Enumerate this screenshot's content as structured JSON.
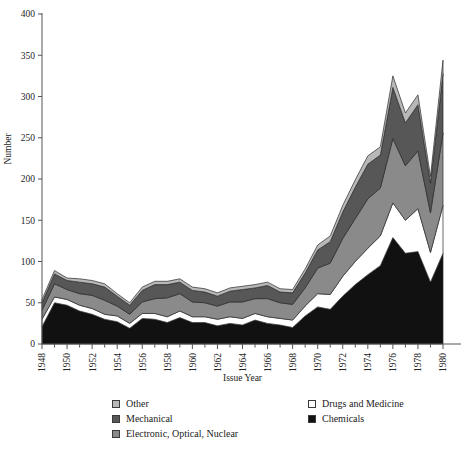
{
  "chart_data": {
    "type": "area",
    "stacked": true,
    "title": "",
    "xlabel": "Issue Year",
    "ylabel": "Number",
    "xlim": [
      1948,
      1980
    ],
    "ylim": [
      0,
      400
    ],
    "yticks": [
      0,
      50,
      100,
      150,
      200,
      250,
      300,
      350,
      400
    ],
    "xticks": [
      1948,
      1950,
      1952,
      1954,
      1956,
      1958,
      1960,
      1962,
      1964,
      1966,
      1968,
      1970,
      1972,
      1974,
      1976,
      1978,
      1980
    ],
    "xtick_labels": [
      "1948",
      "1950",
      "1952",
      "1954",
      "1956",
      "1958",
      "1960",
      "1962",
      "1964",
      "1966",
      "1968",
      "1970",
      "1972",
      "1974",
      "1976",
      "1978",
      "1980"
    ],
    "minor_xticks_every": 1,
    "grid": false,
    "legend_position": "below",
    "x": [
      1948,
      1949,
      1950,
      1951,
      1952,
      1953,
      1954,
      1955,
      1956,
      1957,
      1958,
      1959,
      1960,
      1961,
      1962,
      1963,
      1964,
      1965,
      1966,
      1967,
      1968,
      1969,
      1970,
      1971,
      1972,
      1973,
      1974,
      1975,
      1976,
      1977,
      1978,
      1979,
      1980
    ],
    "stack_order_bottom_to_top": [
      "Chemicals",
      "Drugs and Medicine",
      "Electronic, Optical, Nuclear",
      "Mechanical",
      "Other"
    ],
    "series": [
      {
        "name": "Chemicals",
        "color": "#111111",
        "values": [
          21,
          50,
          47,
          40,
          36,
          30,
          27,
          19,
          31,
          30,
          26,
          32,
          26,
          26,
          22,
          25,
          23,
          29,
          25,
          23,
          20,
          34,
          45,
          42,
          58,
          72,
          84,
          95,
          129,
          110,
          112,
          75,
          110
        ]
      },
      {
        "name": "Drugs and Medicine",
        "color": "#ffffff",
        "values": [
          9,
          7,
          7,
          7,
          7,
          6,
          7,
          6,
          6,
          7,
          7,
          8,
          7,
          7,
          8,
          8,
          8,
          8,
          8,
          8,
          9,
          12,
          16,
          18,
          24,
          28,
          32,
          36,
          42,
          40,
          52,
          36,
          58
        ]
      },
      {
        "name": "Electronic, Optical, Nuclear",
        "color": "#8a8a8a",
        "values": [
          11,
          16,
          12,
          14,
          16,
          17,
          12,
          11,
          14,
          18,
          23,
          21,
          18,
          17,
          16,
          18,
          20,
          18,
          22,
          19,
          19,
          22,
          31,
          38,
          46,
          52,
          60,
          58,
          78,
          66,
          70,
          48,
          88
        ]
      },
      {
        "name": "Mechanical",
        "color": "#575757",
        "values": [
          9,
          12,
          11,
          14,
          14,
          16,
          12,
          11,
          14,
          17,
          16,
          14,
          14,
          13,
          12,
          13,
          15,
          13,
          16,
          13,
          14,
          18,
          22,
          26,
          32,
          38,
          42,
          40,
          62,
          52,
          56,
          36,
          72
        ]
      },
      {
        "name": "Other",
        "color": "#b8b8b8",
        "values": [
          4,
          4,
          3,
          4,
          4,
          4,
          3,
          3,
          4,
          4,
          4,
          4,
          4,
          4,
          4,
          4,
          4,
          4,
          4,
          4,
          4,
          5,
          6,
          7,
          8,
          9,
          10,
          10,
          14,
          12,
          12,
          8,
          16
        ]
      }
    ]
  },
  "legend": {
    "left_column": [
      {
        "label": "Other",
        "color": "#b8b8b8"
      },
      {
        "label": "Mechanical",
        "color": "#575757"
      },
      {
        "label": "Electronic, Optical, Nuclear",
        "color": "#8a8a8a"
      }
    ],
    "right_column": [
      {
        "label": "Drugs and Medicine",
        "color": "#ffffff"
      },
      {
        "label": "Chemicals",
        "color": "#111111"
      }
    ]
  },
  "colors": {
    "background": "#ffffff",
    "axis": "#555555",
    "text": "#1a1a1a",
    "chemicals": "#111111",
    "drugs": "#ffffff",
    "electronic": "#8a8a8a",
    "mechanical": "#575757",
    "other": "#b8b8b8"
  }
}
